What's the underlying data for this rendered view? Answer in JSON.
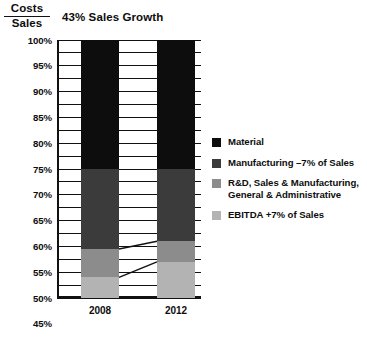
{
  "chart_data": {
    "type": "bar",
    "subtype": "stacked-100-percent-column",
    "title": "43% Sales Growth",
    "xlabel": "",
    "ylabel": "Costs / Sales",
    "ylabel_numerator": "Costs",
    "ylabel_denominator": "Sales",
    "categories": [
      "2008",
      "2012"
    ],
    "ylim": [
      0,
      100
    ],
    "ytick_step": 5,
    "ytick_labels": [
      "0%",
      "5%",
      "10%",
      "15%",
      "20%",
      "25%",
      "30%",
      "35%",
      "40%",
      "45%",
      "50%",
      "55%",
      "60%",
      "65%",
      "70%",
      "75%",
      "80%",
      "85%",
      "90%",
      "95%",
      "100%"
    ],
    "grid": true,
    "legend_position": "right",
    "stack_order_bottom_to_top": [
      "EBITDA +7% of Sales",
      "R&D, Sales & Manufacturing, General & Administrative",
      "Manufacturing –7% of Sales",
      "Material"
    ],
    "series": [
      {
        "name": "EBITDA +7% of Sales",
        "color": "#b3b3b3",
        "values": [
          8,
          14
        ],
        "bounds": [
          [
            0,
            8
          ],
          [
            0,
            14
          ]
        ]
      },
      {
        "name": "R&D, Sales & Manufacturing, General & Administrative",
        "color": "#8c8c8c",
        "values": [
          11,
          8
        ],
        "bounds": [
          [
            8,
            19
          ],
          [
            14,
            22
          ]
        ]
      },
      {
        "name": "Manufacturing –7% of Sales",
        "color": "#3b3b3b",
        "values": [
          31,
          28
        ],
        "bounds": [
          [
            19,
            50
          ],
          [
            22,
            50
          ]
        ]
      },
      {
        "name": "Material",
        "color": "#0d0d0d",
        "values": [
          50,
          50
        ],
        "bounds": [
          [
            50,
            100
          ],
          [
            50,
            100
          ]
        ]
      }
    ],
    "connectors": [
      {
        "from_category": "2008",
        "from_value": 8,
        "to_category": "2012",
        "to_value": 14
      },
      {
        "from_category": "2008",
        "from_value": 19,
        "to_category": "2012",
        "to_value": 22
      }
    ]
  },
  "legend": {
    "items": [
      {
        "label": "Material",
        "label_line2": "",
        "color": "#0d0d0d"
      },
      {
        "label": "Manufacturing –7% of Sales",
        "label_line2": "",
        "color": "#3b3b3b"
      },
      {
        "label": "R&D, Sales & Manufacturing,",
        "label_line2": "General & Administrative",
        "color": "#8c8c8c"
      },
      {
        "label": "EBITDA +7% of Sales",
        "label_line2": "",
        "color": "#b3b3b3"
      }
    ]
  }
}
